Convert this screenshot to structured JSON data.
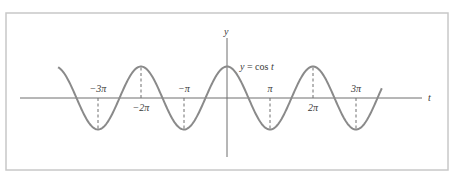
{
  "chart_data": {
    "type": "line",
    "title": "",
    "function_label": "y = cos t",
    "xlabel": "t",
    "ylabel": "y",
    "x_unit": "pi",
    "xlim_pi": [
      -4.0,
      4.6
    ],
    "curve_domain_pi": [
      -3.93,
      3.6
    ],
    "ylim": [
      -1,
      1
    ],
    "grid": false,
    "legend": "none",
    "series": [
      {
        "name": "y = cos t",
        "function": "cos",
        "color": "#8a8a8a"
      }
    ],
    "ticks": [
      {
        "value_pi": -3,
        "label": "−3π",
        "label_side": "above",
        "extremum": "min"
      },
      {
        "value_pi": -2,
        "label": "−2π",
        "label_side": "below",
        "extremum": "max"
      },
      {
        "value_pi": -1,
        "label": "−π",
        "label_side": "above",
        "extremum": "min"
      },
      {
        "value_pi": 1,
        "label": "π",
        "label_side": "above",
        "extremum": "min"
      },
      {
        "value_pi": 2,
        "label": "2π",
        "label_side": "below",
        "extremum": "max"
      },
      {
        "value_pi": 3,
        "label": "3π",
        "label_side": "above",
        "extremum": "min"
      }
    ],
    "annotations": [
      "dashed vertical guide lines from the t-axis to each extremum at multiples of π"
    ]
  },
  "layout": {
    "frame": {
      "x": 6,
      "y": 13,
      "w": 442,
      "h": 157
    },
    "origin": {
      "x": 227,
      "y": 98
    },
    "px_per_pi": 43,
    "amplitude_px": 31.5,
    "x_axis": {
      "x1": 20,
      "x2": 422
    },
    "y_axis": {
      "y1": 38,
      "y2": 157
    },
    "func_label_pos": {
      "x": 240,
      "y": 70
    },
    "xlabel_pos": {
      "x": 428,
      "y": 101
    },
    "ylabel_pos": {
      "x": 224,
      "y": 35
    }
  },
  "colors": {
    "frame": "#c8c8c8",
    "axis": "#6e6e6e",
    "curve": "#8a8a8a",
    "dash": "#6e6e6e",
    "text": "#3a3a3a"
  }
}
